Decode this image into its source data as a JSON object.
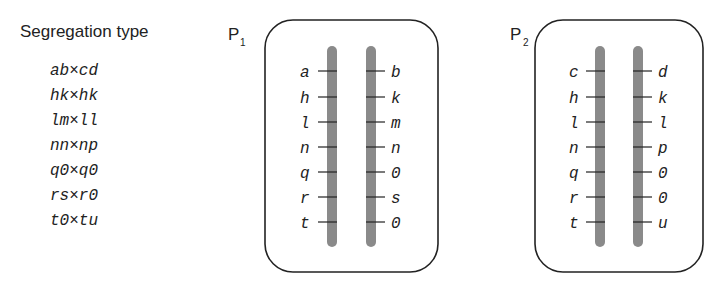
{
  "legend": {
    "title": "Segregation type",
    "types": [
      "ab×cd",
      "hk×hk",
      "lm×ll",
      "nn×np",
      "q0×q0",
      "rs×r0",
      "t0×tu"
    ]
  },
  "parents": [
    {
      "name": "P",
      "subscript": "1",
      "left_alleles": [
        "a",
        "h",
        "l",
        "n",
        "q",
        "r",
        "t"
      ],
      "right_alleles": [
        "b",
        "k",
        "m",
        "n",
        "0",
        "s",
        "0"
      ]
    },
    {
      "name": "P",
      "subscript": "2",
      "left_alleles": [
        "c",
        "h",
        "l",
        "n",
        "q",
        "r",
        "t"
      ],
      "right_alleles": [
        "d",
        "k",
        "l",
        "p",
        "0",
        "0",
        "u"
      ]
    }
  ],
  "colors": {
    "chromosome": "#8a8a8a",
    "outline": "#222222"
  }
}
